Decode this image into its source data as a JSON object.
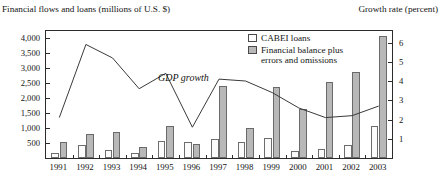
{
  "axis_captions": {
    "left": "Financial flows and loans (millions of U.S. $)",
    "right": "Growth rate (percent)"
  },
  "legend": {
    "items": [
      {
        "label": "CABEI loans",
        "color": "#ffffff",
        "swatch": "cabei"
      },
      {
        "label": "Financial balance plus errors and omissions",
        "color": "#b8b8b8",
        "swatch": "balance"
      }
    ]
  },
  "annotations": [
    {
      "text": "GDP growth",
      "style": "italic"
    }
  ],
  "colors": {
    "bar_cabei_fill": "#fbfbfb",
    "bar_cabei_stroke": "#6d6d6d",
    "bar_balance_fill": "#b8b8b8",
    "bar_balance_stroke": "#6a6a6a",
    "line": "#3a3a3a",
    "frame": "#2b2b2b",
    "text": "#141414"
  },
  "chart_data": {
    "type": "bar",
    "title": "",
    "xlabel": "",
    "ylabel": "Financial flows and loans (millions of U.S. $)",
    "y2label": "Growth rate (percent)",
    "grid": false,
    "legend_position": "top-right",
    "categories": [
      "1991",
      "1992",
      "1993",
      "1994",
      "1995",
      "1996",
      "1997",
      "1998",
      "1999",
      "2000",
      "2001",
      "2002",
      "2003"
    ],
    "ylim": [
      0,
      4250
    ],
    "yticks": [
      "500",
      "1,000",
      "1,500",
      "2,000",
      "2,500",
      "3,000",
      "3,500",
      "4,000"
    ],
    "ytick_values": [
      500,
      1000,
      1500,
      2000,
      2500,
      3000,
      3500,
      4000
    ],
    "y2lim": [
      0,
      6.6
    ],
    "y2ticks": [
      "1",
      "2",
      "3",
      "4",
      "5",
      "6"
    ],
    "y2tick_values": [
      1,
      2,
      3,
      4,
      5,
      6
    ],
    "series": [
      {
        "name": "CABEI loans",
        "kind": "bar",
        "axis": "left",
        "color": "#ffffff",
        "values": [
          180,
          420,
          280,
          160,
          560,
          520,
          620,
          540,
          660,
          250,
          290,
          430,
          1080
        ]
      },
      {
        "name": "Financial balance plus errors and omissions",
        "kind": "bar",
        "axis": "left",
        "color": "#b8b8b8",
        "values": [
          520,
          820,
          880,
          380,
          1080,
          480,
          2400,
          1020,
          2380,
          1640,
          2560,
          2880,
          4080
        ]
      },
      {
        "name": "GDP growth",
        "kind": "line",
        "axis": "right",
        "color": "#3a3a3a",
        "values": [
          2.1,
          5.9,
          5.2,
          3.6,
          4.4,
          1.6,
          4.1,
          4.0,
          3.4,
          2.6,
          2.1,
          2.2,
          2.7
        ]
      }
    ]
  }
}
